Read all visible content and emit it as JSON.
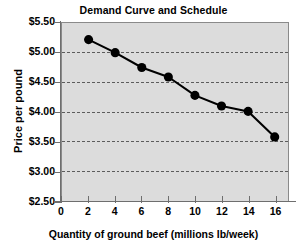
{
  "chart_data": {
    "type": "line",
    "title": "Demand Curve and Schedule",
    "xlabel": "Quantity of ground beef (millions lb/week)",
    "ylabel": "Price per pound",
    "x": [
      2,
      4,
      6,
      8,
      10,
      12,
      14,
      16
    ],
    "values": [
      5.22,
      5.0,
      4.75,
      4.59,
      4.28,
      4.1,
      4.01,
      3.58
    ],
    "series": [
      {
        "name": "Demand",
        "values": [
          5.22,
          5.0,
          4.75,
          4.59,
          4.28,
          4.1,
          4.01,
          3.58
        ]
      }
    ],
    "xlim": [
      0,
      17
    ],
    "ylim": [
      2.5,
      5.5
    ],
    "xticks": [
      0,
      2,
      4,
      6,
      8,
      10,
      12,
      14,
      16
    ],
    "xtick_labels": [
      "0",
      "2",
      "4",
      "6",
      "8",
      "10",
      "12",
      "14",
      "16"
    ],
    "yticks": [
      2.5,
      3.0,
      3.5,
      4.0,
      4.5,
      5.0,
      5.5
    ],
    "ytick_labels": [
      "$2.50",
      "$3.00",
      "$3.50",
      "$4.00",
      "$4.50",
      "$5.00",
      "$5.50"
    ],
    "grid": true,
    "grid_axis": "y",
    "legend": false,
    "legend_position": "none",
    "marker": "circle",
    "colors": {
      "line": "#000000",
      "marker": "#000000",
      "plot_background": "#dcdcdc",
      "gridline": "#5a5a5a",
      "axis": "#6e6e6e",
      "text": "#000000",
      "figure_background": "#ffffff"
    }
  }
}
